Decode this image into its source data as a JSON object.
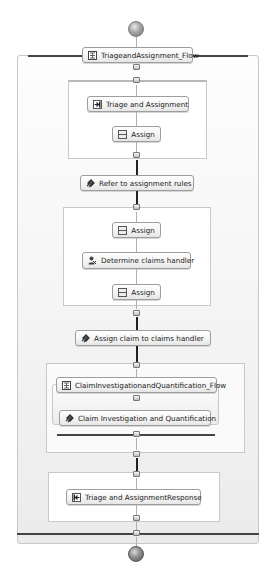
{
  "diagram": {
    "type": "bpel-process-flow",
    "start_node": {
      "shape": "circle",
      "label": ""
    },
    "end_node": {
      "shape": "circle",
      "label": ""
    },
    "outer_flow": {
      "label": "TriageandAssignment_Flow",
      "icon": "flow-icon"
    },
    "scope1": {
      "items": [
        {
          "label": "Triage and Assignment",
          "icon": "receive-icon"
        },
        {
          "label": "Assign",
          "icon": "assign-icon"
        }
      ]
    },
    "refer_rules": {
      "label": "Refer to assignment rules",
      "icon": "invoke-icon"
    },
    "scope2": {
      "items": [
        {
          "label": "Assign",
          "icon": "assign-icon"
        },
        {
          "label": "Determine claims handler",
          "icon": "human-task-icon"
        },
        {
          "label": "Assign",
          "icon": "assign-icon"
        }
      ]
    },
    "assign_claim": {
      "label": "Assign claim to claims handler",
      "icon": "invoke-icon"
    },
    "scope3": {
      "inner_flow": {
        "label": "ClaimInvestigationandQuantification_Flow",
        "icon": "flow-icon"
      },
      "items": [
        {
          "label": "Claim Investigation and Quantification",
          "icon": "invoke-icon"
        }
      ]
    },
    "scope4": {
      "items": [
        {
          "label": "Triage and AssignmentResponse",
          "icon": "reply-icon"
        }
      ]
    },
    "colors": {
      "node_border": "#9d9d9d",
      "container_border": "#c8c8c8",
      "flow_bar": "#444444",
      "arrow_thick": "#222222",
      "arrow_thin": "#b0b0b0"
    }
  }
}
